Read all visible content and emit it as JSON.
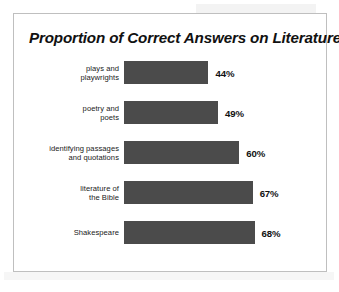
{
  "chart_data": {
    "type": "bar",
    "orientation": "horizontal",
    "title": "Proportion of Correct Answers on Literature",
    "xlabel": "",
    "ylabel": "",
    "xlim": [
      0,
      100
    ],
    "grid": false,
    "legend": null,
    "value_suffix": "%",
    "bar_color": "#4b4b4b",
    "background_color": "#ffffff",
    "border_color": "#bfbfbf",
    "categories": [
      "plays and playwrights",
      "poetry and poets",
      "identifying passages and quotations",
      "literature of the Bible",
      "Shakespeare"
    ],
    "values": [
      44,
      49,
      60,
      67,
      68
    ],
    "bars": [
      {
        "label_line1": "plays and",
        "label_line2": "playwrights",
        "value": 44,
        "value_label": "44%"
      },
      {
        "label_line1": "poetry and",
        "label_line2": "poets",
        "value": 49,
        "value_label": "49%"
      },
      {
        "label_line1": "identifying passages",
        "label_line2": "and quotations",
        "value": 60,
        "value_label": "60%"
      },
      {
        "label_line1": "literature of",
        "label_line2": "the Bible",
        "value": 67,
        "value_label": "67%"
      },
      {
        "label_line1": "Shakespeare",
        "label_line2": "",
        "value": 68,
        "value_label": "68%"
      }
    ]
  }
}
